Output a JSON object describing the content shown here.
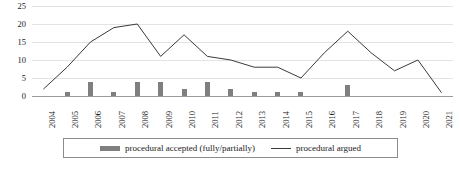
{
  "chart_data": {
    "type": "bar",
    "title": "",
    "subtitle": "",
    "xlabel": "",
    "ylabel": "",
    "ylim": [
      0,
      25
    ],
    "yticks": [
      0,
      5,
      10,
      15,
      20,
      25
    ],
    "grid": true,
    "legend_position": "bottom",
    "categories": [
      "2004",
      "2005",
      "2006",
      "2007",
      "2008",
      "2009",
      "2010",
      "2011",
      "2012",
      "2013",
      "2014",
      "2015",
      "2016",
      "2017",
      "2018",
      "2019",
      "2020",
      "2021"
    ],
    "series": [
      {
        "name": "procedural accepted (fully/partially)",
        "type": "bar",
        "color": "#7f7f7f",
        "values": [
          0,
          1,
          4,
          1,
          4,
          4,
          2,
          4,
          2,
          1,
          1,
          1,
          0,
          3,
          0,
          0,
          0,
          0
        ]
      },
      {
        "name": "procedural argued",
        "type": "line",
        "color": "#3a3a3a",
        "values": [
          2,
          8,
          15,
          19,
          20,
          11,
          17,
          11,
          10,
          8,
          8,
          5,
          12,
          18,
          12,
          7,
          10,
          1
        ]
      }
    ]
  },
  "legend": {
    "entries": [
      {
        "label": "procedural accepted (fully/partially)",
        "marker": "bar"
      },
      {
        "label": "procedural argued",
        "marker": "line"
      }
    ]
  },
  "axis": {
    "y_tick_labels": [
      "0",
      "5",
      "10",
      "15",
      "20",
      "25"
    ],
    "x_tick_labels": [
      "2004",
      "2005",
      "2006",
      "2007",
      "2008",
      "2009",
      "2010",
      "2011",
      "2012",
      "2013",
      "2014",
      "2015",
      "2016",
      "2017",
      "2018",
      "2019",
      "2020",
      "2021"
    ]
  },
  "colors": {
    "bar": "#7f7f7f",
    "line": "#3a3a3a",
    "gridline": "#e3e3e3",
    "baseline": "#9a9a9a",
    "legend_border": "#8c8c8c",
    "text": "#1a1a1a"
  }
}
